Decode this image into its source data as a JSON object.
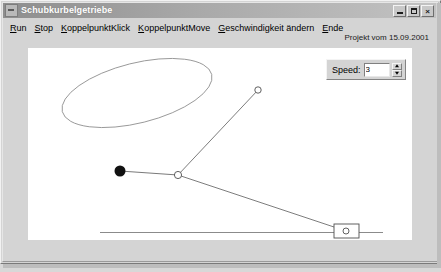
{
  "window": {
    "title": "Schubkurbelgetriebe",
    "icon": "app-icon",
    "buttons": {
      "minimize": "_",
      "maximize": "□",
      "close": "×"
    }
  },
  "menu": {
    "items": [
      {
        "mnemonic": "R",
        "rest": "un",
        "name": "run"
      },
      {
        "mnemonic": "S",
        "rest": "top",
        "name": "stop"
      },
      {
        "mnemonic": "K",
        "rest": "oppelpunktKlick",
        "name": "koppelpunkt-klick"
      },
      {
        "mnemonic": "K",
        "rest": "oppelpunktMove",
        "name": "koppelpunkt-move"
      },
      {
        "mnemonic": "G",
        "rest": "eschwindigkeit ändern",
        "name": "geschwindigkeit-aendern"
      },
      {
        "mnemonic": "E",
        "rest": "nde",
        "name": "ende"
      }
    ]
  },
  "header": {
    "project_date": "Projekt vom 15.09.2001"
  },
  "speed_panel": {
    "label": "Speed:",
    "value": "3",
    "placeholder": "3",
    "spin_up": "spin-up",
    "spin_down": "spin-down"
  },
  "canvas": {
    "background": "#ffffff",
    "stroke": "#707070",
    "pivot_fill": "#000000",
    "description": "Schubkurbelgetriebe (slider-crank mechanism) animation with coupler curve trace",
    "elements": {
      "coupler_curve": "tilted ellipse trace",
      "ground_pivot": "filled black circle",
      "crank_joint": "open circle joint",
      "coupler_point": "open circle joint on ellipse",
      "slider_block": "rectangle with circle",
      "guide_line": "horizontal slider track"
    }
  }
}
